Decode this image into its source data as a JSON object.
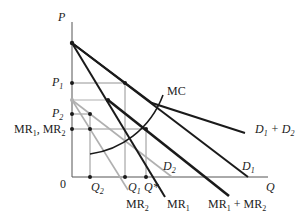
{
  "diagram": {
    "axes": {
      "y_label": "P",
      "x_label": "Q",
      "origin_label": "0"
    },
    "price_labels": {
      "p1": "P",
      "p1_sub": "1",
      "p2": "P",
      "p2_sub": "2",
      "mr_level": "MR",
      "mr_level_sub1": "1",
      "mr_level_mid": ", MR",
      "mr_level_sub2": "2"
    },
    "quantity_labels": {
      "q2": "Q",
      "q2_sub": "2",
      "q1": "Q",
      "q1_sub": "1",
      "qstar": "Q*"
    },
    "curve_labels": {
      "mc": "MC",
      "d1d2": "D",
      "d1d2_sub1": "1",
      "d1d2_mid": " + D",
      "d1d2_sub2": "2",
      "d1": "D",
      "d1_sub": "1",
      "d2": "D",
      "d2_sub": "2",
      "mr1": "MR",
      "mr1_sub": "1",
      "mr2": "MR",
      "mr2_sub": "2",
      "mr1mr2": "MR",
      "mr1mr2_sub1": "1",
      "mr1mr2_mid": " + MR",
      "mr1mr2_sub2": "2"
    },
    "colors": {
      "dark": "#1a1a1a",
      "gray": "#b0b0b0",
      "guide": "#888888"
    }
  }
}
